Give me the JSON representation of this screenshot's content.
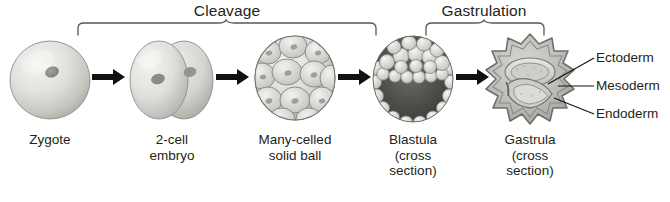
{
  "figure": {
    "background_color": "#ffffff",
    "text_color": "#231f20"
  },
  "phases": [
    {
      "id": "cleavage",
      "label": "Cleavage"
    },
    {
      "id": "gastrulation",
      "label": "Gastrulation"
    }
  ],
  "stages": [
    {
      "id": "zygote",
      "line1": "Zygote",
      "line2": "",
      "line3": ""
    },
    {
      "id": "two-cell",
      "line1": "2-cell",
      "line2": "embryo",
      "line3": ""
    },
    {
      "id": "morula",
      "line1": "Many-celled",
      "line2": "solid ball",
      "line3": ""
    },
    {
      "id": "blastula",
      "line1": "Blastula",
      "line2": "(cross",
      "line3": "section)"
    },
    {
      "id": "gastrula",
      "line1": "Gastrula",
      "line2": "(cross",
      "line3": "section)"
    }
  ],
  "germ_layers": [
    {
      "id": "ectoderm",
      "label": "Ectoderm"
    },
    {
      "id": "mesoderm",
      "label": "Mesoderm"
    },
    {
      "id": "endoderm",
      "label": "Endoderm"
    }
  ],
  "arrows": {
    "count": 4,
    "glyph": "arrow-right-icon"
  },
  "colors": {
    "cell_light": "#e8e8e6",
    "cell_mid": "#c9c9c5",
    "cell_shadow": "#9a9a96",
    "nucleus": "#8e8e8a",
    "cavity_dark": "#4a4a48",
    "outline": "#6f6f6b",
    "line": "#231f20"
  }
}
